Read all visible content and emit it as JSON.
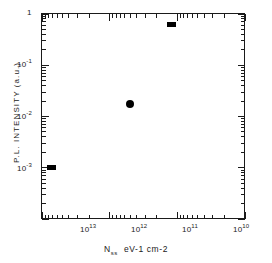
{
  "chart_data": {
    "type": "scatter",
    "title": "",
    "xlabel": "N_ss  eV-1 cm-2",
    "ylabel": "P.L. INTENSITY  (a.u.)",
    "xscale": "log",
    "yscale": "log",
    "x_reversed": true,
    "xlim": [
      10000000000000.0,
      10000000000.0
    ],
    "ylim": [
      0.0001,
      1
    ],
    "grid": false,
    "legend": null,
    "x_tick_labels": [
      "10^13",
      "10^12",
      "10^11",
      "10^10"
    ],
    "x_tick_values": [
      10000000000000.0,
      1000000000000.0,
      100000000000.0,
      10000000000.0
    ],
    "y_tick_labels": [
      "1",
      "10^-1",
      "10^-2",
      "10^-3"
    ],
    "y_tick_values": [
      1,
      0.1,
      0.01,
      0.001
    ],
    "minor_ticks": true,
    "points": [
      {
        "x": 7000000000000.0,
        "y": 0.001,
        "marker": "square"
      },
      {
        "x": 500000000000.0,
        "y": 0.017,
        "marker": "circle"
      },
      {
        "x": 120000000000.0,
        "y": 0.6,
        "marker": "square"
      }
    ]
  },
  "axes": {
    "x_title_main": "N",
    "x_title_sub": "ss",
    "x_title_units": "eV-1 cm-2",
    "y_title": "P.L.  INTENSITY   (a.u.)",
    "x_labels": [
      {
        "mantissa": "10",
        "exponent": "13"
      },
      {
        "mantissa": "10",
        "exponent": "12"
      },
      {
        "mantissa": "10",
        "exponent": "11"
      },
      {
        "mantissa": "10",
        "exponent": "10"
      }
    ],
    "y_labels": [
      {
        "mantissa": "1",
        "exponent": ""
      },
      {
        "mantissa": "10",
        "exponent": "-1"
      },
      {
        "mantissa": "10",
        "exponent": "-2"
      },
      {
        "mantissa": "10",
        "exponent": "-3"
      }
    ]
  },
  "style": {
    "axis_color": "#1a1a1a",
    "marker_color": "#000000",
    "background": "#ffffff"
  }
}
